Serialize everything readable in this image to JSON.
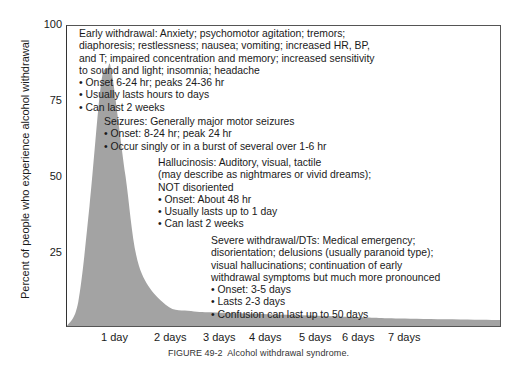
{
  "chart_data": {
    "type": "area",
    "title": "",
    "xlabel": "",
    "ylabel": "Percent of people who experience alcohol withdrawal",
    "ylim": [
      0,
      100
    ],
    "yticks": [
      "100",
      "75",
      "50",
      "25"
    ],
    "xticks": [
      "1 day",
      "2 days",
      "3 days",
      "4 days",
      "5 days",
      "6 days",
      "7 days"
    ],
    "grid": false,
    "fill_color": "#a3a3a3",
    "series": [
      {
        "name": "Withdrawal incidence",
        "x_days": [
          0.0,
          0.25,
          0.5,
          0.75,
          0.9,
          1.0,
          1.25,
          1.5,
          2.0,
          2.5,
          3.0,
          4.0,
          5.0,
          6.0,
          7.0,
          7.5
        ],
        "values": [
          0,
          8,
          40,
          80,
          86,
          84,
          50,
          20,
          7,
          5,
          4.5,
          4,
          3.5,
          3,
          2.5,
          2
        ]
      }
    ],
    "annotations": [
      {
        "heading": "Early withdrawal:",
        "lines": [
          "Early withdrawal: Anxiety; psychomotor agitation; tremors;",
          "diaphoresis; restlessness; nausea; vomiting; increased HR, BP,",
          "and T; impaired concentration and memory; increased sensitivity",
          "to sound and light; insomnia; headache",
          "• Onset 6-24 hr; peaks 24-36 hr",
          "• Usually lasts hours to days",
          "• Can last 2 weeks"
        ]
      },
      {
        "heading": "Seizures:",
        "lines": [
          "Seizures: Generally major motor seizures",
          "• Onset: 8-24 hr; peak 24 hr",
          "• Occur singly or in a burst of several over 1-6 hr"
        ]
      },
      {
        "heading": "Hallucinosis:",
        "lines": [
          "Hallucinosis: Auditory, visual, tactile",
          "(may describe as nightmares or vivid dreams);",
          "NOT disoriented",
          "• Onset: About 48 hr",
          "• Usually lasts up to 1 day",
          "• Can last 2 weeks"
        ]
      },
      {
        "heading": "Severe withdrawal/DTs:",
        "lines": [
          "Severe withdrawal/DTs: Medical emergency;",
          "disorientation; delusions (usually paranoid type);",
          "visual hallucinations; continuation of early",
          "withdrawal symptoms but much more pronounced",
          "• Onset: 3-5 days",
          "• Lasts 2-3 days",
          "• Confusion can last up to 50 days"
        ]
      }
    ]
  },
  "caption": {
    "figure_label": "FIGURE 49-2",
    "text": "Alcohol withdrawal syndrome."
  }
}
